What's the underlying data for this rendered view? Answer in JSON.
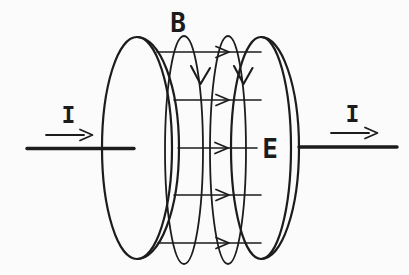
{
  "diagram": {
    "labels": {
      "current_left": "I",
      "current_right": "I",
      "magnetic_field": "B",
      "electric_field": "E"
    },
    "counts": {
      "e_field_lines": 5,
      "b_field_loops": 2
    },
    "colors": {
      "line": "#1c1c1c",
      "background": "#fbfbfb"
    }
  }
}
